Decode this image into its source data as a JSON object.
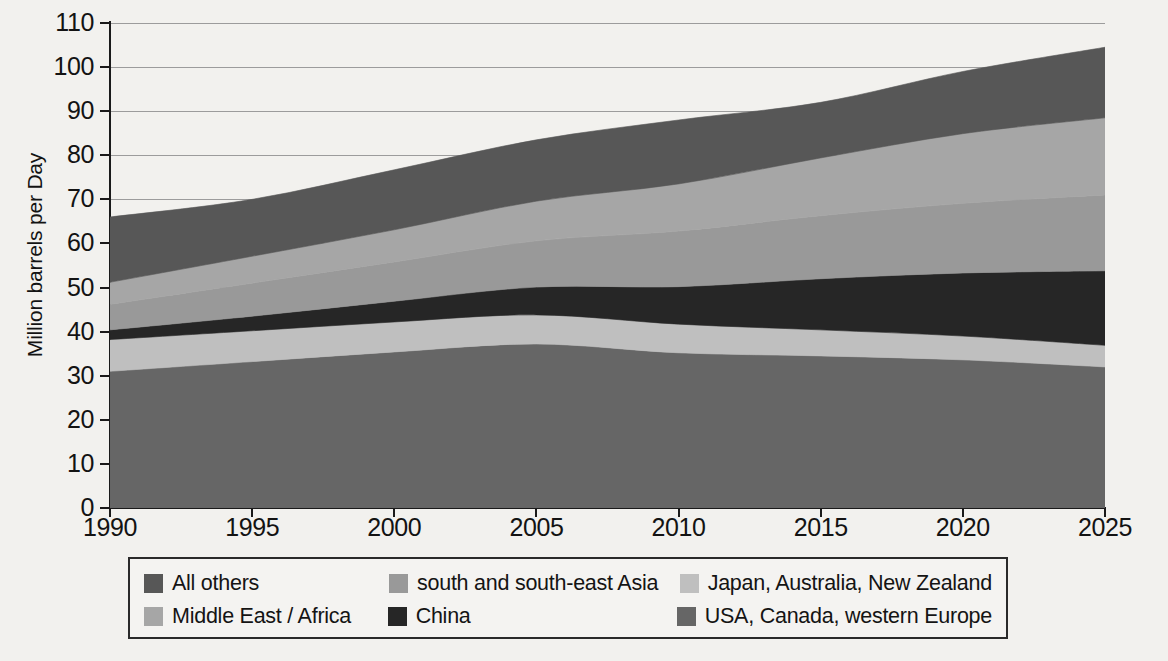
{
  "chart_data": {
    "type": "area",
    "title": "",
    "subtitle": "",
    "xlabel": "",
    "ylabel": "Million barrels per Day",
    "stacked": true,
    "grid": true,
    "grid_axis": "y",
    "legend_position": "bottom",
    "x": [
      1990,
      1995,
      2000,
      2005,
      2010,
      2015,
      2020,
      2025
    ],
    "xticks": [
      "1990",
      "1995",
      "2000",
      "2005",
      "2010",
      "2015",
      "2020",
      "2025"
    ],
    "yticks": [
      "0",
      "10",
      "20",
      "30",
      "40",
      "50",
      "60",
      "70",
      "80",
      "90",
      "100",
      "110"
    ],
    "xlim": [
      1990,
      2025
    ],
    "ylim": [
      0,
      110
    ],
    "series": [
      {
        "name": "USA, Canada, western Europe",
        "color": "#666666",
        "values": [
          31.0,
          33.2,
          35.4,
          37.2,
          35.2,
          34.5,
          33.6,
          32.0
        ],
        "cumulative_top": [
          31.0,
          33.2,
          35.4,
          37.2,
          35.2,
          34.5,
          33.6,
          32.0
        ]
      },
      {
        "name": "Japan, Australia, New Zealand",
        "color": "#bfbfbf",
        "values": [
          7.2,
          7.0,
          6.8,
          6.6,
          6.5,
          5.9,
          5.4,
          4.9
        ],
        "cumulative_top": [
          38.2,
          40.2,
          42.2,
          43.8,
          41.7,
          40.4,
          39.0,
          36.9
        ]
      },
      {
        "name": "China",
        "color": "#262626",
        "values": [
          2.2,
          3.3,
          4.7,
          6.3,
          8.5,
          11.6,
          14.3,
          16.9
        ],
        "cumulative_top": [
          40.4,
          43.5,
          46.9,
          50.1,
          50.2,
          52.0,
          53.3,
          53.8
        ]
      },
      {
        "name": "south and south-east Asia",
        "color": "#999999",
        "values": [
          5.8,
          7.5,
          8.9,
          10.5,
          12.6,
          14.3,
          15.8,
          17.2
        ],
        "cumulative_top": [
          46.2,
          51.0,
          55.8,
          60.6,
          62.8,
          66.3,
          69.1,
          71.0
        ]
      },
      {
        "name": "Middle East / Africa",
        "color": "#a6a6a6",
        "values": [
          5.0,
          6.1,
          7.3,
          9.0,
          10.7,
          13.1,
          15.8,
          17.5
        ],
        "cumulative_top": [
          51.2,
          57.1,
          63.1,
          69.6,
          73.5,
          79.4,
          84.9,
          88.5
        ]
      },
      {
        "name": "All others",
        "color": "#575757",
        "values": [
          14.8,
          12.9,
          13.6,
          13.9,
          14.5,
          12.6,
          14.1,
          16.0
        ],
        "cumulative_top": [
          66.0,
          70.0,
          76.7,
          83.5,
          88.0,
          92.0,
          99.0,
          104.5
        ]
      }
    ],
    "total": [
      66.0,
      70.0,
      76.7,
      83.5,
      88.0,
      92.0,
      99.0,
      104.5
    ]
  },
  "axes": {
    "y_title": "Million barrels per Day",
    "y_ticks": [
      {
        "label": "110",
        "value": 110
      },
      {
        "label": "100",
        "value": 100
      },
      {
        "label": "90",
        "value": 90
      },
      {
        "label": "80",
        "value": 80
      },
      {
        "label": "70",
        "value": 70
      },
      {
        "label": "60",
        "value": 60
      },
      {
        "label": "50",
        "value": 50
      },
      {
        "label": "40",
        "value": 40
      },
      {
        "label": "30",
        "value": 30
      },
      {
        "label": "20",
        "value": 20
      },
      {
        "label": "10",
        "value": 10
      },
      {
        "label": "0",
        "value": 0
      }
    ],
    "x_ticks": [
      {
        "label": "1990",
        "value": 1990
      },
      {
        "label": "1995",
        "value": 1995
      },
      {
        "label": "2000",
        "value": 2000
      },
      {
        "label": "2005",
        "value": 2005
      },
      {
        "label": "2010",
        "value": 2010
      },
      {
        "label": "2015",
        "value": 2015
      },
      {
        "label": "2020",
        "value": 2020
      },
      {
        "label": "2025",
        "value": 2025
      }
    ]
  },
  "legend": {
    "rows": [
      [
        {
          "label": "All others",
          "color": "#575757"
        },
        {
          "label": "south and south-east Asia",
          "color": "#999999"
        },
        {
          "label": "Japan, Australia, New Zealand",
          "color": "#bfbfbf"
        }
      ],
      [
        {
          "label": "Middle East / Africa",
          "color": "#a6a6a6"
        },
        {
          "label": "China",
          "color": "#262626"
        },
        {
          "label": "USA, Canada, western Europe",
          "color": "#666666"
        }
      ]
    ]
  },
  "style": {
    "background": "#f2f1ee",
    "axis_color": "#1a1a1a",
    "grid_color": "#8d8d8d",
    "text_color": "#131313"
  }
}
